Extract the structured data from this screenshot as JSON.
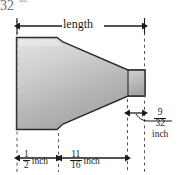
{
  "figure": {
    "kind": "engineering-dimension-drawing",
    "background_color": "#ffffff",
    "outline_color": "#2b2b2b",
    "fill_light": "#e2e2e2",
    "fill_mid": "#b9b9b9",
    "fill_dark": "#9a9a9a",
    "dimension_line_color": "#1b1b1b",
    "extension_line_color": "#4a4a4a"
  },
  "dimensions": {
    "length": {
      "label": "length",
      "position": "top",
      "arrows": "both"
    },
    "left_section": {
      "numerator": "1",
      "denominator": "2",
      "unit": "inch",
      "position": "bottom",
      "arrows": "both"
    },
    "taper_section": {
      "numerator": "11",
      "denominator": "16",
      "unit": "inch",
      "position": "bottom",
      "arrows": "both"
    },
    "neck_section": {
      "numerator": "9",
      "denominator": "32",
      "unit": "inch",
      "position": "right",
      "arrows": "both"
    }
  },
  "page_bleed": {
    "number": "32",
    "unit": "in."
  }
}
